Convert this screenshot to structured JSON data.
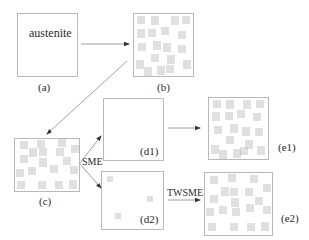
{
  "diagram": {
    "type": "shape-memory-effect-microstructure-schematic",
    "colors": {
      "box_stroke": "#b8b8b8",
      "hatch": "#a8a8a8",
      "arrow": "#888888",
      "text": "#2a2a2a"
    },
    "panels": [
      {
        "id": "a",
        "label": "(a)",
        "content_text": "austenite",
        "state": "austenite"
      },
      {
        "id": "b",
        "label": "(b)",
        "state": "self-accommodated martensite"
      },
      {
        "id": "c",
        "label": "(c)",
        "state": "deformed martensite"
      },
      {
        "id": "d1",
        "label": "(d1)",
        "state": "austenite after SME"
      },
      {
        "id": "d2",
        "label": "(d2)",
        "state": "austenite with retained variants"
      },
      {
        "id": "e1",
        "label": "(e1)",
        "state": "self-accommodated martensite"
      },
      {
        "id": "e2",
        "label": "(e2)",
        "state": "oriented martensite (TWSME)"
      }
    ],
    "edges": [
      {
        "from": "a",
        "to": "b",
        "label": ""
      },
      {
        "from": "b",
        "to": "c",
        "label": ""
      },
      {
        "from": "c",
        "to": "d1",
        "label": "SME"
      },
      {
        "from": "c",
        "to": "d2",
        "label": "SME"
      },
      {
        "from": "d1",
        "to": "e1",
        "label": ""
      },
      {
        "from": "d2",
        "to": "e2",
        "label": "TWSME"
      }
    ],
    "edge_labels": {
      "sme": "SME",
      "twsme": "TWSME"
    }
  }
}
